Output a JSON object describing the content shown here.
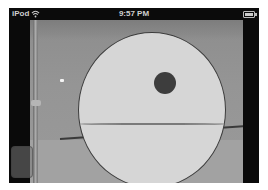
{
  "statusbar": {
    "carrier": "iPod",
    "wifi_icon": "wifi-icon",
    "time": "9:57 PM",
    "battery_icon": "battery-icon"
  },
  "camera_view": {
    "overlay_circle": {
      "fill": "#d6d6d6",
      "stroke": "#3c3c3c"
    },
    "marker_dot": {
      "color": "#3d3d3d"
    }
  },
  "controls": {
    "overlay_button_icon": "translucent-button"
  }
}
